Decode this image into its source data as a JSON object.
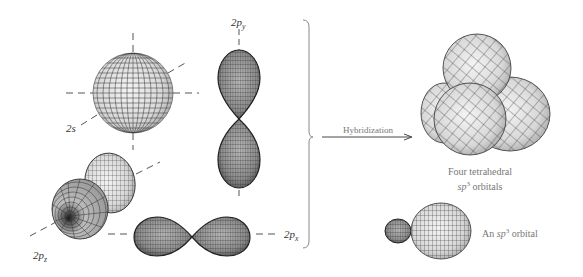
{
  "diagram": {
    "left_group": {
      "orbitals": [
        {
          "id": "2s",
          "label": "2s",
          "shape": "sphere"
        },
        {
          "id": "2py",
          "label_main": "2p",
          "label_sub": "y",
          "shape": "dumbbell-vertical"
        },
        {
          "id": "2pz",
          "label_main": "2p",
          "label_sub": "z",
          "shape": "dumbbell-diagonal"
        },
        {
          "id": "2px",
          "label_main": "2p",
          "label_sub": "x",
          "shape": "dumbbell-horizontal"
        }
      ]
    },
    "arrow": {
      "label": "Hybridization"
    },
    "right_group": {
      "tetrahedral_caption_line1": "Four tetrahedral",
      "tetrahedral_caption_line2_pre": "sp",
      "tetrahedral_caption_line2_sup": "3",
      "tetrahedral_caption_line2_post": " orbitals",
      "single_caption_pre": "An ",
      "single_caption_italic": "sp",
      "single_caption_sup": "3",
      "single_caption_post": " orbital"
    },
    "colors": {
      "lobe_fill": "#d9d9d9",
      "lobe_dark": "#8a8a8a",
      "grid_line": "#444444",
      "axis_dash": "#555555",
      "text": "#333333",
      "caption_text": "#777777",
      "brace": "#888888"
    }
  }
}
